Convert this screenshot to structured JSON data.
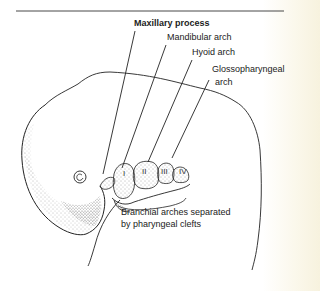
{
  "diagram": {
    "type": "anatomical-illustration",
    "labels": {
      "maxillary": "Maxillary process",
      "mandibular": "Mandibular arch",
      "hyoid": "Hyoid arch",
      "glosso_line1": "Glossopharyngeal",
      "glosso_line2": "arch",
      "clefts_line1": "Branchial arches separated",
      "clefts_line2": "by pharyngeal clefts"
    },
    "arch_numerals": [
      "I",
      "II",
      "III",
      "IV"
    ],
    "colors": {
      "ink": "#222222",
      "paper": "#ffffff",
      "paper_edge": "#f7f2de"
    }
  }
}
